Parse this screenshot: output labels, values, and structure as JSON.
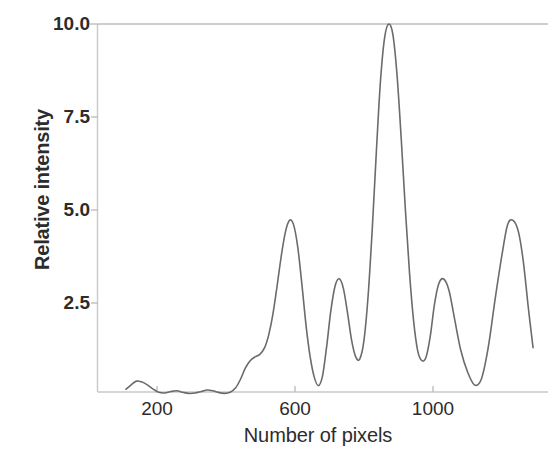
{
  "chart_data": {
    "type": "line",
    "title": "",
    "subtitle": "",
    "xlabel": "Number of pixels",
    "ylabel": "Relative intensity",
    "xlim": [
      110,
      1300
    ],
    "ylim": [
      0,
      10
    ],
    "xticks": [
      200,
      600,
      1000
    ],
    "xtick_labels": [
      "200",
      "600",
      "1000"
    ],
    "yticks": [
      2.5,
      5.0,
      7.5,
      10.0
    ],
    "ytick_labels": [
      "2.5",
      "5.0",
      "7.5",
      "10.0"
    ],
    "grid": false,
    "legend": null,
    "legend_position": "none",
    "line_color": "#6b6b6b",
    "line_width": 1.6,
    "annotations": [],
    "series": [
      {
        "name": "Relative intensity profile",
        "x": [
          110,
          125,
          140,
          155,
          172,
          190,
          205,
          222,
          240,
          258,
          275,
          292,
          310,
          328,
          345,
          362,
          380,
          396,
          412,
          428,
          442,
          456,
          470,
          484,
          498,
          512,
          524,
          536,
          548,
          560,
          572,
          584,
          596,
          608,
          620,
          632,
          644,
          656,
          668,
          680,
          692,
          704,
          716,
          728,
          740,
          752,
          764,
          776,
          788,
          800,
          812,
          824,
          836,
          848,
          860,
          872,
          884,
          896,
          908,
          920,
          932,
          944,
          956,
          968,
          980,
          992,
          1004,
          1016,
          1030,
          1046,
          1062,
          1080,
          1100,
          1120,
          1140,
          1160,
          1180,
          1200,
          1216,
          1232,
          1248,
          1262,
          1276,
          1290
        ],
        "y": [
          0.18,
          0.3,
          0.4,
          0.38,
          0.3,
          0.18,
          0.1,
          0.08,
          0.12,
          0.14,
          0.1,
          0.07,
          0.08,
          0.12,
          0.16,
          0.14,
          0.09,
          0.07,
          0.1,
          0.22,
          0.45,
          0.75,
          0.95,
          1.05,
          1.12,
          1.3,
          1.65,
          2.2,
          2.95,
          3.75,
          4.4,
          4.72,
          4.6,
          4.0,
          3.0,
          1.9,
          1.05,
          0.5,
          0.28,
          0.55,
          1.35,
          2.3,
          2.95,
          3.15,
          2.9,
          2.25,
          1.5,
          1.05,
          1.0,
          1.5,
          2.7,
          4.5,
          6.6,
          8.5,
          9.65,
          10.0,
          9.7,
          8.6,
          6.9,
          5.0,
          3.3,
          2.0,
          1.2,
          0.95,
          1.05,
          1.6,
          2.45,
          3.0,
          3.15,
          2.85,
          2.1,
          1.25,
          0.65,
          0.3,
          0.45,
          1.3,
          2.6,
          3.8,
          4.6,
          4.72,
          4.4,
          3.6,
          2.4,
          1.3
        ]
      }
    ],
    "features": {
      "central_peak": {
        "x": 672,
        "y": 10.0
      },
      "first_order_peaks": [
        {
          "x": 584,
          "y": 4.72
        },
        {
          "x": 768,
          "y": 4.72
        }
      ],
      "second_order_peaks": [
        {
          "x": 512,
          "y": 3.15
        },
        {
          "x": 840,
          "y": 3.15
        }
      ],
      "baseline_level": 0.12
    }
  },
  "axes": {
    "ylabel": "Relative intensity",
    "xlabel": "Number of pixels",
    "ytick_labels": [
      "10.0",
      "7.5",
      "5.0",
      "2.5"
    ],
    "xtick_labels": [
      "200",
      "600",
      "1000"
    ]
  }
}
